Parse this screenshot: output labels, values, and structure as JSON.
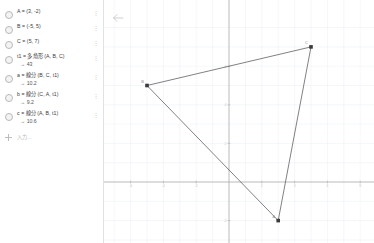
{
  "app": {
    "name": "GeoGebra Graphing",
    "accent_color": "#1565c0",
    "object_color": "#4a4a4a",
    "axis_color": "#b0b0b0",
    "grid_color": "#e9eef2"
  },
  "algebra_panel": {
    "menu_glyph": "⋮",
    "rows": [
      {
        "definition": "A = (3, -2)",
        "value": ""
      },
      {
        "definition": "B = (-5, 5)",
        "value": ""
      },
      {
        "definition": "C = (5, 7)",
        "value": ""
      },
      {
        "definition": "t1 = 多角形 (A, B, C)",
        "value": "→ 43"
      },
      {
        "definition": "a = 線分 (B, C, t1)",
        "value": "→ 10.2"
      },
      {
        "definition": "b = 線分 (C, A, t1)",
        "value": "→ 9.2"
      },
      {
        "definition": "c = 線分 (A, B, t1)",
        "value": "→ 10.6"
      }
    ],
    "input": {
      "add_label": "+",
      "placeholder": "入力..."
    }
  },
  "graphics_panel": {
    "back_label": "←"
  },
  "chart_data": {
    "type": "scatter",
    "title": "",
    "xlabel": "",
    "ylabel": "",
    "xlim": [
      -11,
      9
    ],
    "ylim": [
      -5,
      8
    ],
    "grid": true,
    "legend": false,
    "x_ticks": [
      -10,
      -8,
      -6,
      -4,
      -2,
      2,
      4,
      6,
      8
    ],
    "y_ticks": [
      -4,
      -2,
      2,
      4,
      6
    ],
    "points": [
      {
        "name": "A",
        "x": 3,
        "y": -2
      },
      {
        "name": "B",
        "x": -5,
        "y": 5
      },
      {
        "name": "C",
        "x": 5,
        "y": 7
      }
    ],
    "polygon": {
      "name": "t1",
      "vertices": [
        "A",
        "B",
        "C"
      ],
      "area": 43
    },
    "segments": [
      {
        "name": "a",
        "from": "B",
        "to": "C",
        "length": 10.2
      },
      {
        "name": "b",
        "from": "C",
        "to": "A",
        "length": 9.2
      },
      {
        "name": "c",
        "from": "A",
        "to": "B",
        "length": 10.6
      }
    ]
  }
}
